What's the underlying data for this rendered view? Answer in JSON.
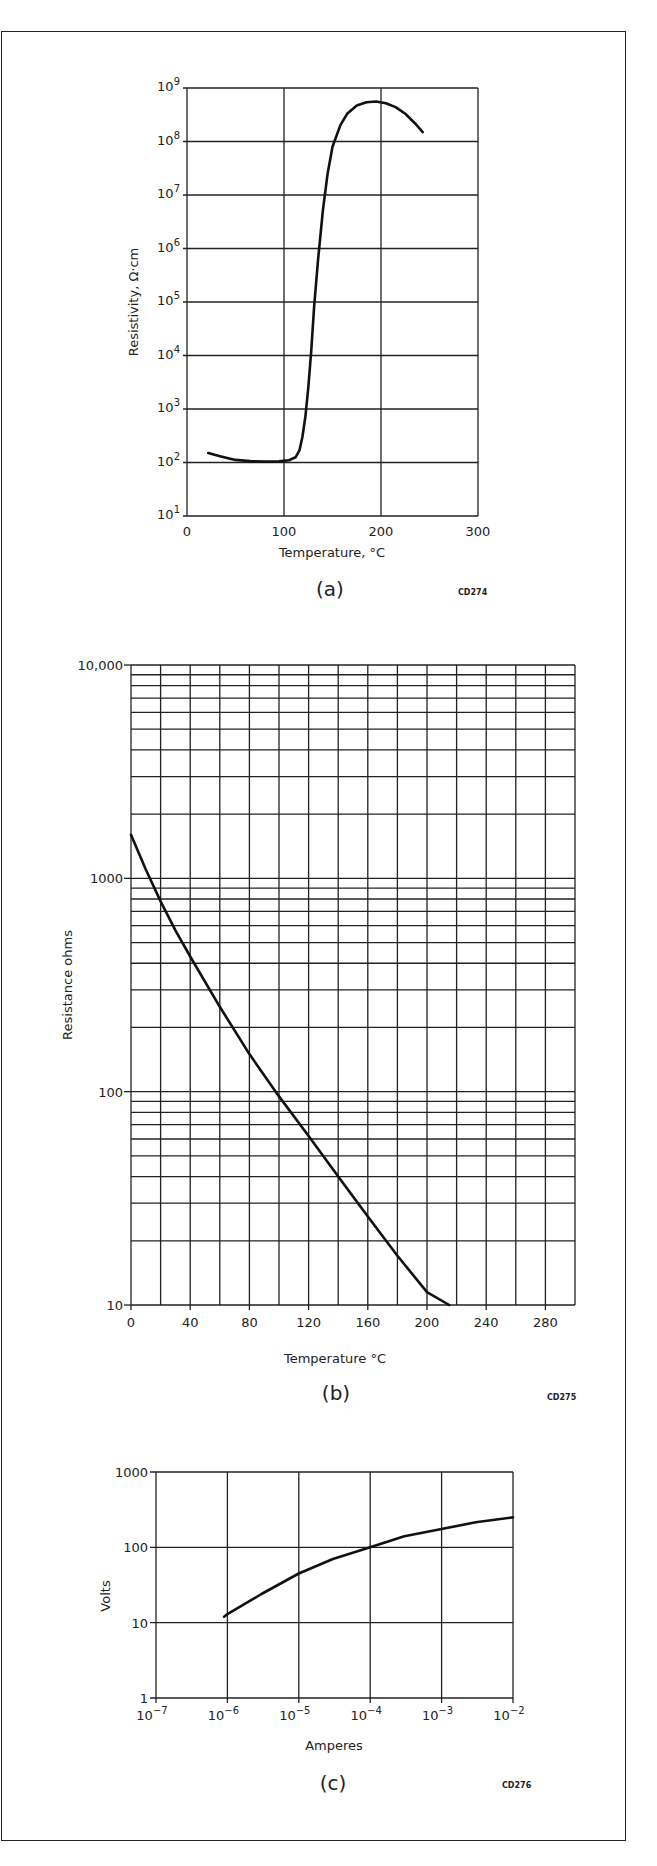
{
  "figure": {
    "panels": [
      "(a)",
      "(b)",
      "(c)"
    ],
    "codes": [
      "CD274",
      "CD275",
      "CD276"
    ]
  },
  "chart_data": [
    {
      "id": "a",
      "type": "line",
      "title": "",
      "panel_label": "(a)",
      "code": "CD274",
      "xlabel": "Temperature, °C",
      "ylabel": "Resistivity, Ω·cm",
      "xscale": "linear",
      "yscale": "log",
      "xlim": [
        0,
        300
      ],
      "ylim": [
        10,
        1000000000
      ],
      "x_ticks": [
        0,
        100,
        200,
        300
      ],
      "x_tick_labels": [
        "0",
        "100",
        "200",
        "300"
      ],
      "y_ticks_exp": [
        1,
        2,
        3,
        4,
        5,
        6,
        7,
        8,
        9
      ],
      "y_tick_labels": [
        "10^1",
        "10^2",
        "10^3",
        "10^4",
        "10^5",
        "10^6",
        "10^7",
        "10^8",
        "10^9"
      ],
      "grid": true,
      "series": [
        {
          "name": "resistivity",
          "x": [
            22,
            35,
            50,
            65,
            80,
            95,
            105,
            112,
            116,
            119,
            122,
            125,
            128,
            131,
            135,
            140,
            145,
            150,
            158,
            165,
            175,
            185,
            195,
            205,
            215,
            225,
            235,
            243
          ],
          "y": [
            150,
            130,
            112,
            106,
            104,
            105,
            110,
            125,
            170,
            300,
            700,
            2500,
            12000,
            80000,
            600000,
            5000000,
            25000000,
            80000000,
            200000000,
            330000000,
            470000000,
            540000000,
            560000000,
            520000000,
            440000000,
            330000000,
            220000000,
            150000000
          ]
        }
      ]
    },
    {
      "id": "b",
      "type": "line",
      "title": "",
      "panel_label": "(b)",
      "code": "CD275",
      "xlabel": "Temperature °C",
      "ylabel": "Resistance ohms",
      "xscale": "linear",
      "yscale": "log",
      "xlim": [
        0,
        300
      ],
      "ylim": [
        10,
        10000
      ],
      "x_ticks": [
        0,
        40,
        80,
        120,
        160,
        200,
        240,
        280
      ],
      "x_tick_labels": [
        "0",
        "40",
        "80",
        "120",
        "160",
        "200",
        "240",
        "280"
      ],
      "x_grid_step": 20,
      "y_ticks": [
        10,
        100,
        1000,
        10000
      ],
      "y_tick_labels": [
        "10",
        "100",
        "1000",
        "10,000"
      ],
      "grid": true,
      "series": [
        {
          "name": "resistance",
          "x": [
            0,
            10,
            20,
            30,
            40,
            60,
            80,
            100,
            120,
            140,
            160,
            180,
            200,
            215
          ],
          "y": [
            1600,
            1100,
            780,
            570,
            430,
            250,
            150,
            95,
            62,
            40,
            26,
            17,
            11.5,
            10
          ]
        }
      ]
    },
    {
      "id": "c",
      "type": "line",
      "title": "",
      "panel_label": "(c)",
      "code": "CD276",
      "xlabel": "Amperes",
      "ylabel": "Volts",
      "xscale": "log",
      "yscale": "log",
      "xlim": [
        1e-07,
        0.01
      ],
      "ylim": [
        1,
        1000
      ],
      "x_ticks_exp": [
        -7,
        -6,
        -5,
        -4,
        -3,
        -2
      ],
      "x_tick_labels": [
        "10^-7",
        "10^-6",
        "10^-5",
        "10^-4",
        "10^-3",
        "10^-2"
      ],
      "y_ticks": [
        1,
        10,
        100,
        1000
      ],
      "y_tick_labels": [
        "1",
        "10",
        "100",
        "1000"
      ],
      "grid": true,
      "series": [
        {
          "name": "voltage",
          "x": [
            9e-07,
            1e-06,
            3e-06,
            1e-05,
            3e-05,
            0.0001,
            0.0003,
            0.001,
            0.003,
            0.01
          ],
          "y": [
            12,
            13,
            24,
            45,
            70,
            100,
            140,
            175,
            215,
            250
          ]
        }
      ]
    }
  ]
}
